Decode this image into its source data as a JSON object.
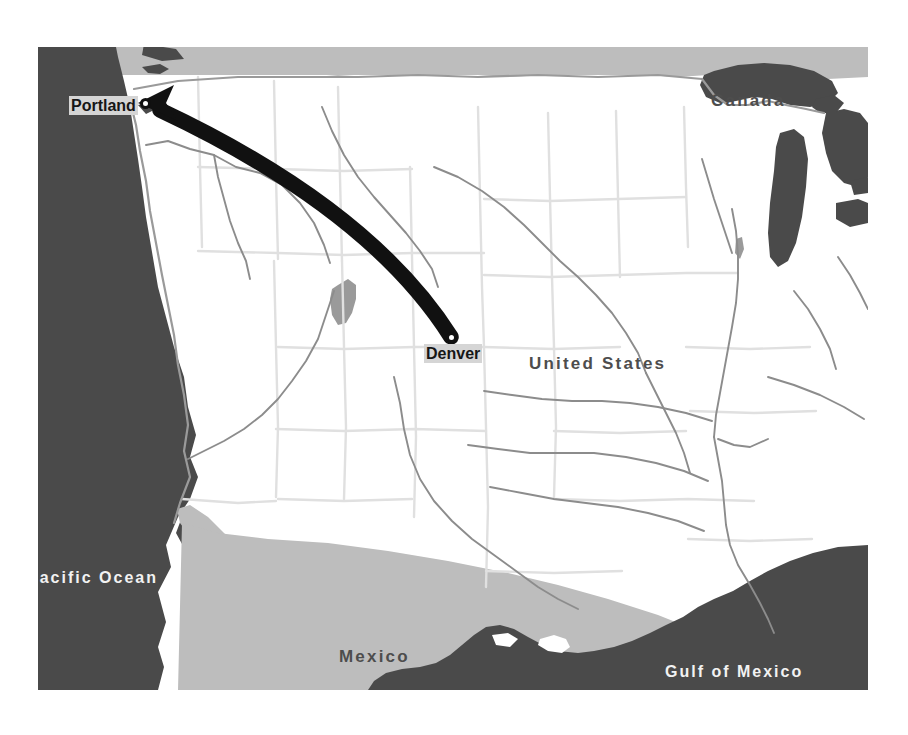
{
  "figure": {
    "kind": "reference-map",
    "title_visible": false,
    "background_color": "#ffffff"
  },
  "map": {
    "projection_area": "Western and Central United States, Northern Mexico, Southern Canada",
    "colors": {
      "land": "#ffffff",
      "foreign_land": "#bdbdbd",
      "water": "#4a4a4a",
      "state_border": "#e0e0e0",
      "country_border": "#9a9a9a",
      "river": "#8c8c8c",
      "route_arrow": "#111111",
      "city_marker_fill": "#ffffff",
      "city_marker_stroke": "#111111",
      "label_halo": "#d5d5d5"
    },
    "country_labels": [
      {
        "name": "canada-label",
        "text": "Canada",
        "x": 673,
        "y": 52,
        "style": "country"
      },
      {
        "name": "united-states-label",
        "text": "United States",
        "x": 529,
        "y": 362,
        "style": "country"
      },
      {
        "name": "mexico-label",
        "text": "Mexico",
        "x": 339,
        "y": 655,
        "style": "country"
      }
    ],
    "water_labels": [
      {
        "name": "pacific-ocean-label",
        "text": "Pacific Ocean",
        "x": 27,
        "y": 576,
        "style": "ocean"
      },
      {
        "name": "gulf-of-mexico-label",
        "text": "Gulf of Mexico",
        "x": 665,
        "y": 670,
        "style": "ocean"
      }
    ],
    "cities": [
      {
        "name": "portland",
        "label": "Portland",
        "label_x": 69,
        "label_y": 99,
        "dot_x": 145,
        "dot_y": 103,
        "role": "destination"
      },
      {
        "name": "denver",
        "label": "Denver",
        "label_x": 424,
        "label_y": 346,
        "dot_x": 451,
        "dot_y": 337,
        "role": "origin"
      }
    ],
    "route": {
      "name": "denver-to-portland-route",
      "from": "Denver",
      "to": "Portland",
      "style": "curved-arrow",
      "direction": "westbound",
      "has_arrowhead": true
    }
  }
}
